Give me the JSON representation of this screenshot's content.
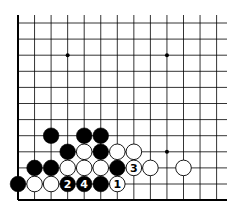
{
  "diagram": {
    "type": "go-board-corner",
    "corner": "bottom-left",
    "colors": {
      "background": "#ffffff",
      "line": "#000000",
      "black_stone": "#000000",
      "white_stone": "#ffffff"
    },
    "grid": {
      "columns": 13,
      "rows": 12,
      "origin_x": 18,
      "origin_y": 23,
      "spacing_x": 16.55,
      "spacing_y": 16.1,
      "left_edge": "thick",
      "bottom_edge": "thick",
      "top_edge": "open",
      "right_edge": "open"
    },
    "star_points": [
      {
        "col": 3,
        "row": 2
      },
      {
        "col": 9,
        "row": 2
      },
      {
        "col": 9,
        "row": 8
      }
    ],
    "stones": [
      {
        "col": 2,
        "row": 7,
        "color": "black",
        "label": ""
      },
      {
        "col": 4,
        "row": 7,
        "color": "black",
        "label": ""
      },
      {
        "col": 5,
        "row": 7,
        "color": "black",
        "label": ""
      },
      {
        "col": 3,
        "row": 8,
        "color": "black",
        "label": ""
      },
      {
        "col": 4,
        "row": 8,
        "color": "white",
        "label": ""
      },
      {
        "col": 5,
        "row": 8,
        "color": "black",
        "label": ""
      },
      {
        "col": 6,
        "row": 8,
        "color": "white",
        "label": ""
      },
      {
        "col": 7,
        "row": 8,
        "color": "white",
        "label": ""
      },
      {
        "col": 1,
        "row": 9,
        "color": "black",
        "label": ""
      },
      {
        "col": 2,
        "row": 9,
        "color": "black",
        "label": ""
      },
      {
        "col": 3,
        "row": 9,
        "color": "white",
        "label": ""
      },
      {
        "col": 4,
        "row": 9,
        "color": "white",
        "label": ""
      },
      {
        "col": 5,
        "row": 9,
        "color": "white",
        "label": ""
      },
      {
        "col": 6,
        "row": 9,
        "color": "black",
        "label": ""
      },
      {
        "col": 7,
        "row": 9,
        "color": "white",
        "label": "3"
      },
      {
        "col": 8,
        "row": 9,
        "color": "white",
        "label": ""
      },
      {
        "col": 10,
        "row": 9,
        "color": "white",
        "label": ""
      },
      {
        "col": 0,
        "row": 10,
        "color": "black",
        "label": ""
      },
      {
        "col": 1,
        "row": 10,
        "color": "white",
        "label": ""
      },
      {
        "col": 2,
        "row": 10,
        "color": "white",
        "label": ""
      },
      {
        "col": 3,
        "row": 10,
        "color": "black",
        "label": "2"
      },
      {
        "col": 4,
        "row": 10,
        "color": "black",
        "label": "4"
      },
      {
        "col": 5,
        "row": 10,
        "color": "black",
        "label": ""
      },
      {
        "col": 6,
        "row": 10,
        "color": "white",
        "label": "1"
      }
    ],
    "move_labels": [
      "1",
      "2",
      "3",
      "4"
    ]
  }
}
